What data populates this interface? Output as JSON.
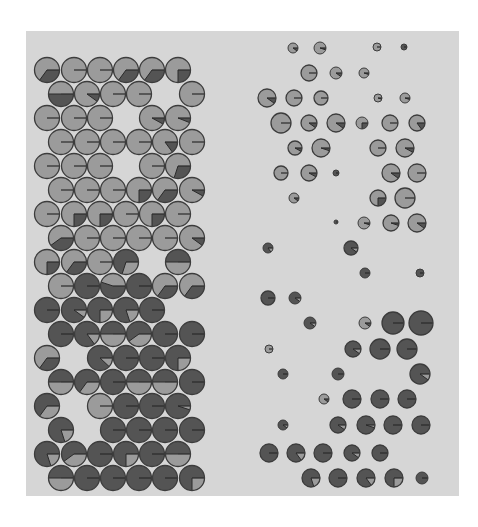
{
  "figure": {
    "colors": {
      "panel": "#d6d6d6",
      "light": "#9b9b9b",
      "dark": "#545454",
      "outline": "#3c3c3c",
      "line": "#2a2a2a"
    }
  },
  "chart_data": {
    "type": "scatter",
    "title": "",
    "xlabel": "",
    "ylabel": "",
    "grid": false,
    "legend": "none",
    "note": "Pie glyphs: base = base colour, f = fraction of wedge drawn in the other colour starting at 3 o'clock going clockwise; r = glyph radius in px",
    "left_grid": [
      {
        "x": 47,
        "y": 70,
        "r": 12.5,
        "base": "light",
        "f": 0.35
      },
      {
        "x": 74,
        "y": 70,
        "r": 12.5,
        "base": "light",
        "f": 0.0
      },
      {
        "x": 100,
        "y": 70,
        "r": 12.5,
        "base": "light",
        "f": 0.0
      },
      {
        "x": 126,
        "y": 70,
        "r": 12.5,
        "base": "light",
        "f": 0.35
      },
      {
        "x": 152,
        "y": 70,
        "r": 12.5,
        "base": "light",
        "f": 0.35
      },
      {
        "x": 178,
        "y": 70,
        "r": 12.5,
        "base": "light",
        "f": 0.25
      },
      {
        "x": 61,
        "y": 94,
        "r": 12.5,
        "base": "light",
        "f": 0.5
      },
      {
        "x": 87,
        "y": 94,
        "r": 12.5,
        "base": "light",
        "f": 0.1
      },
      {
        "x": 113,
        "y": 94,
        "r": 12.5,
        "base": "light",
        "f": 0.0
      },
      {
        "x": 139,
        "y": 94,
        "r": 12.5,
        "base": "light",
        "f": 0.0
      },
      {
        "x": 192,
        "y": 94,
        "r": 12.5,
        "base": "light",
        "f": 0.0
      },
      {
        "x": 47,
        "y": 118,
        "r": 12.5,
        "base": "light",
        "f": 0.0
      },
      {
        "x": 74,
        "y": 118,
        "r": 12.5,
        "base": "light",
        "f": 0.0
      },
      {
        "x": 100,
        "y": 118,
        "r": 12.5,
        "base": "light",
        "f": 0.0
      },
      {
        "x": 152,
        "y": 118,
        "r": 12.5,
        "base": "light",
        "f": 0.08
      },
      {
        "x": 178,
        "y": 118,
        "r": 12.5,
        "base": "light",
        "f": 0.06
      },
      {
        "x": 61,
        "y": 142,
        "r": 12.5,
        "base": "light",
        "f": 0.0
      },
      {
        "x": 87,
        "y": 142,
        "r": 12.5,
        "base": "light",
        "f": 0.0
      },
      {
        "x": 113,
        "y": 142,
        "r": 12.5,
        "base": "light",
        "f": 0.0
      },
      {
        "x": 139,
        "y": 142,
        "r": 12.5,
        "base": "light",
        "f": 0.0
      },
      {
        "x": 165,
        "y": 142,
        "r": 12.5,
        "base": "light",
        "f": 0.15
      },
      {
        "x": 192,
        "y": 142,
        "r": 12.5,
        "base": "light",
        "f": 0.0
      },
      {
        "x": 47,
        "y": 166,
        "r": 12.5,
        "base": "light",
        "f": 0.0
      },
      {
        "x": 74,
        "y": 166,
        "r": 12.5,
        "base": "light",
        "f": 0.0
      },
      {
        "x": 100,
        "y": 166,
        "r": 12.5,
        "base": "light",
        "f": 0.0
      },
      {
        "x": 152,
        "y": 166,
        "r": 12.5,
        "base": "light",
        "f": 0.0
      },
      {
        "x": 178,
        "y": 166,
        "r": 12.5,
        "base": "light",
        "f": 0.3
      },
      {
        "x": 61,
        "y": 190,
        "r": 12.5,
        "base": "light",
        "f": 0.0
      },
      {
        "x": 87,
        "y": 190,
        "r": 12.5,
        "base": "light",
        "f": 0.0
      },
      {
        "x": 113,
        "y": 190,
        "r": 12.5,
        "base": "light",
        "f": 0.0
      },
      {
        "x": 139,
        "y": 190,
        "r": 12.5,
        "base": "light",
        "f": 0.25
      },
      {
        "x": 165,
        "y": 190,
        "r": 12.5,
        "base": "light",
        "f": 0.35
      },
      {
        "x": 192,
        "y": 190,
        "r": 12.5,
        "base": "light",
        "f": 0.08
      },
      {
        "x": 47,
        "y": 214,
        "r": 12.5,
        "base": "light",
        "f": 0.0
      },
      {
        "x": 74,
        "y": 214,
        "r": 12.5,
        "base": "light",
        "f": 0.25
      },
      {
        "x": 100,
        "y": 214,
        "r": 12.5,
        "base": "light",
        "f": 0.25
      },
      {
        "x": 126,
        "y": 214,
        "r": 12.5,
        "base": "light",
        "f": 0.0
      },
      {
        "x": 152,
        "y": 214,
        "r": 12.5,
        "base": "light",
        "f": 0.25
      },
      {
        "x": 178,
        "y": 214,
        "r": 12.5,
        "base": "light",
        "f": 0.0
      },
      {
        "x": 61,
        "y": 238,
        "r": 12.5,
        "base": "light",
        "f": 0.4
      },
      {
        "x": 87,
        "y": 238,
        "r": 12.5,
        "base": "light",
        "f": 0.0
      },
      {
        "x": 113,
        "y": 238,
        "r": 12.5,
        "base": "light",
        "f": 0.0
      },
      {
        "x": 139,
        "y": 238,
        "r": 12.5,
        "base": "light",
        "f": 0.0
      },
      {
        "x": 165,
        "y": 238,
        "r": 12.5,
        "base": "light",
        "f": 0.0
      },
      {
        "x": 192,
        "y": 238,
        "r": 12.5,
        "base": "light",
        "f": 0.1
      },
      {
        "x": 47,
        "y": 262,
        "r": 12.5,
        "base": "light",
        "f": 0.25
      },
      {
        "x": 74,
        "y": 262,
        "r": 12.5,
        "base": "light",
        "f": 0.35
      },
      {
        "x": 100,
        "y": 262,
        "r": 12.5,
        "base": "light",
        "f": 0.0
      },
      {
        "x": 126,
        "y": 262,
        "r": 12.5,
        "base": "dark",
        "f": 0.3
      },
      {
        "x": 178,
        "y": 262,
        "r": 12.5,
        "base": "dark",
        "f": 0.5
      },
      {
        "x": 61,
        "y": 286,
        "r": 12.5,
        "base": "light",
        "f": 0.0
      },
      {
        "x": 87,
        "y": 286,
        "r": 12.5,
        "base": "dark",
        "f": 0.0
      },
      {
        "x": 113,
        "y": 286,
        "r": 12.5,
        "base": "light",
        "f": 0.55
      },
      {
        "x": 139,
        "y": 286,
        "r": 12.5,
        "base": "dark",
        "f": 0.0
      },
      {
        "x": 165,
        "y": 286,
        "r": 12.5,
        "base": "light",
        "f": 0.35
      },
      {
        "x": 192,
        "y": 286,
        "r": 12.5,
        "base": "light",
        "f": 0.35
      },
      {
        "x": 47,
        "y": 310,
        "r": 12.5,
        "base": "dark",
        "f": 0.0
      },
      {
        "x": 74,
        "y": 310,
        "r": 12.5,
        "base": "dark",
        "f": 0.1
      },
      {
        "x": 100,
        "y": 310,
        "r": 12.5,
        "base": "dark",
        "f": 0.25
      },
      {
        "x": 126,
        "y": 310,
        "r": 12.5,
        "base": "dark",
        "f": 0.2
      },
      {
        "x": 152,
        "y": 310,
        "r": 12.5,
        "base": "dark",
        "f": 0.0
      },
      {
        "x": 61,
        "y": 334,
        "r": 12.5,
        "base": "dark",
        "f": 0.0
      },
      {
        "x": 87,
        "y": 334,
        "r": 12.5,
        "base": "dark",
        "f": 0.15
      },
      {
        "x": 113,
        "y": 334,
        "r": 12.5,
        "base": "dark",
        "f": 0.5
      },
      {
        "x": 139,
        "y": 334,
        "r": 12.5,
        "base": "dark",
        "f": 0.4
      },
      {
        "x": 165,
        "y": 334,
        "r": 12.5,
        "base": "dark",
        "f": 0.0
      },
      {
        "x": 192,
        "y": 334,
        "r": 12.5,
        "base": "dark",
        "f": 0.0
      },
      {
        "x": 47,
        "y": 358,
        "r": 12.5,
        "base": "light",
        "f": 0.35
      },
      {
        "x": 100,
        "y": 358,
        "r": 12.5,
        "base": "dark",
        "f": 0.12
      },
      {
        "x": 126,
        "y": 358,
        "r": 12.5,
        "base": "dark",
        "f": 0.0
      },
      {
        "x": 152,
        "y": 358,
        "r": 12.5,
        "base": "dark",
        "f": 0.0
      },
      {
        "x": 178,
        "y": 358,
        "r": 12.5,
        "base": "dark",
        "f": 0.25
      },
      {
        "x": 61,
        "y": 382,
        "r": 12.5,
        "base": "dark",
        "f": 0.5
      },
      {
        "x": 87,
        "y": 382,
        "r": 12.5,
        "base": "dark",
        "f": 0.35
      },
      {
        "x": 113,
        "y": 382,
        "r": 12.5,
        "base": "dark",
        "f": 0.0
      },
      {
        "x": 139,
        "y": 382,
        "r": 12.5,
        "base": "dark",
        "f": 0.5
      },
      {
        "x": 165,
        "y": 382,
        "r": 12.5,
        "base": "dark",
        "f": 0.5
      },
      {
        "x": 192,
        "y": 382,
        "r": 12.5,
        "base": "dark",
        "f": 0.0
      },
      {
        "x": 47,
        "y": 406,
        "r": 12.5,
        "base": "dark",
        "f": 0.35
      },
      {
        "x": 100,
        "y": 406,
        "r": 12.5,
        "base": "light",
        "f": 0.0
      },
      {
        "x": 126,
        "y": 406,
        "r": 12.5,
        "base": "dark",
        "f": 0.0
      },
      {
        "x": 152,
        "y": 406,
        "r": 12.5,
        "base": "dark",
        "f": 0.0
      },
      {
        "x": 178,
        "y": 406,
        "r": 12.5,
        "base": "dark",
        "f": 0.05
      },
      {
        "x": 61,
        "y": 430,
        "r": 12.5,
        "base": "dark",
        "f": 0.2
      },
      {
        "x": 113,
        "y": 430,
        "r": 12.5,
        "base": "dark",
        "f": 0.0
      },
      {
        "x": 139,
        "y": 430,
        "r": 12.5,
        "base": "dark",
        "f": 0.0
      },
      {
        "x": 165,
        "y": 430,
        "r": 12.5,
        "base": "dark",
        "f": 0.0
      },
      {
        "x": 192,
        "y": 430,
        "r": 12.5,
        "base": "dark",
        "f": 0.0
      },
      {
        "x": 47,
        "y": 454,
        "r": 12.5,
        "base": "dark",
        "f": 0.2
      },
      {
        "x": 74,
        "y": 454,
        "r": 12.5,
        "base": "dark",
        "f": 0.4
      },
      {
        "x": 100,
        "y": 454,
        "r": 12.5,
        "base": "dark",
        "f": 0.0
      },
      {
        "x": 126,
        "y": 454,
        "r": 12.5,
        "base": "dark",
        "f": 0.25
      },
      {
        "x": 152,
        "y": 454,
        "r": 12.5,
        "base": "dark",
        "f": 0.0
      },
      {
        "x": 178,
        "y": 454,
        "r": 12.5,
        "base": "dark",
        "f": 0.5
      },
      {
        "x": 61,
        "y": 478,
        "r": 12.5,
        "base": "dark",
        "f": 0.5
      },
      {
        "x": 87,
        "y": 478,
        "r": 12.5,
        "base": "dark",
        "f": 0.0
      },
      {
        "x": 113,
        "y": 478,
        "r": 12.5,
        "base": "dark",
        "f": 0.0
      },
      {
        "x": 139,
        "y": 478,
        "r": 12.5,
        "base": "dark",
        "f": 0.0
      },
      {
        "x": 165,
        "y": 478,
        "r": 12.5,
        "base": "dark",
        "f": 0.0
      },
      {
        "x": 192,
        "y": 478,
        "r": 12.5,
        "base": "dark",
        "f": 0.25
      }
    ],
    "right_grid": [
      {
        "x": 293,
        "y": 48,
        "r": 5,
        "base": "light",
        "f": 0.1
      },
      {
        "x": 320,
        "y": 48,
        "r": 6,
        "base": "light",
        "f": 0.05
      },
      {
        "x": 377,
        "y": 47,
        "r": 4,
        "base": "light",
        "f": 0.0
      },
      {
        "x": 404,
        "y": 47,
        "r": 3,
        "base": "dark",
        "f": 0.0
      },
      {
        "x": 309,
        "y": 73,
        "r": 8,
        "base": "light",
        "f": 0.0
      },
      {
        "x": 336,
        "y": 73,
        "r": 6,
        "base": "light",
        "f": 0.1
      },
      {
        "x": 364,
        "y": 73,
        "r": 5,
        "base": "light",
        "f": 0.05
      },
      {
        "x": 267,
        "y": 98,
        "r": 9,
        "base": "light",
        "f": 0.1
      },
      {
        "x": 294,
        "y": 98,
        "r": 8,
        "base": "light",
        "f": 0.0
      },
      {
        "x": 321,
        "y": 98,
        "r": 7,
        "base": "light",
        "f": 0.0
      },
      {
        "x": 378,
        "y": 98,
        "r": 4,
        "base": "light",
        "f": 0.05
      },
      {
        "x": 405,
        "y": 98,
        "r": 5,
        "base": "light",
        "f": 0.05
      },
      {
        "x": 281,
        "y": 123,
        "r": 10,
        "base": "light",
        "f": 0.0
      },
      {
        "x": 309,
        "y": 123,
        "r": 8,
        "base": "light",
        "f": 0.1
      },
      {
        "x": 336,
        "y": 123,
        "r": 9,
        "base": "light",
        "f": 0.1
      },
      {
        "x": 362,
        "y": 123,
        "r": 6,
        "base": "light",
        "f": 0.25
      },
      {
        "x": 390,
        "y": 123,
        "r": 8,
        "base": "light",
        "f": 0.0
      },
      {
        "x": 417,
        "y": 123,
        "r": 8,
        "base": "light",
        "f": 0.15
      },
      {
        "x": 295,
        "y": 148,
        "r": 7,
        "base": "light",
        "f": 0.08
      },
      {
        "x": 321,
        "y": 148,
        "r": 9,
        "base": "light",
        "f": 0.05
      },
      {
        "x": 378,
        "y": 148,
        "r": 8,
        "base": "light",
        "f": 0.0
      },
      {
        "x": 405,
        "y": 148,
        "r": 9,
        "base": "light",
        "f": 0.08
      },
      {
        "x": 281,
        "y": 173,
        "r": 7,
        "base": "light",
        "f": 0.0
      },
      {
        "x": 309,
        "y": 173,
        "r": 8,
        "base": "light",
        "f": 0.08
      },
      {
        "x": 336,
        "y": 173,
        "r": 3,
        "base": "dark",
        "f": 0.0
      },
      {
        "x": 391,
        "y": 173,
        "r": 9,
        "base": "light",
        "f": 0.1
      },
      {
        "x": 417,
        "y": 173,
        "r": 9,
        "base": "light",
        "f": 0.0
      },
      {
        "x": 294,
        "y": 198,
        "r": 5,
        "base": "light",
        "f": 0.1
      },
      {
        "x": 378,
        "y": 198,
        "r": 8,
        "base": "light",
        "f": 0.25
      },
      {
        "x": 405,
        "y": 198,
        "r": 10,
        "base": "light",
        "f": 0.0
      },
      {
        "x": 336,
        "y": 222,
        "r": 2,
        "base": "dark",
        "f": 0.0
      },
      {
        "x": 364,
        "y": 223,
        "r": 6,
        "base": "light",
        "f": 0.05
      },
      {
        "x": 391,
        "y": 223,
        "r": 8,
        "base": "light",
        "f": 0.05
      },
      {
        "x": 417,
        "y": 223,
        "r": 9,
        "base": "light",
        "f": 0.1
      },
      {
        "x": 268,
        "y": 248,
        "r": 5,
        "base": "dark",
        "f": 0.15
      },
      {
        "x": 351,
        "y": 248,
        "r": 7,
        "base": "dark",
        "f": 0.1
      },
      {
        "x": 365,
        "y": 273,
        "r": 5,
        "base": "dark",
        "f": 0.0
      },
      {
        "x": 420,
        "y": 273,
        "r": 4,
        "base": "dark",
        "f": 0.0
      },
      {
        "x": 268,
        "y": 298,
        "r": 7,
        "base": "dark",
        "f": 0.0
      },
      {
        "x": 295,
        "y": 298,
        "r": 6,
        "base": "dark",
        "f": 0.1
      },
      {
        "x": 310,
        "y": 323,
        "r": 6,
        "base": "dark",
        "f": 0.1
      },
      {
        "x": 365,
        "y": 323,
        "r": 6,
        "base": "light",
        "f": 0.1
      },
      {
        "x": 393,
        "y": 323,
        "r": 11,
        "base": "dark",
        "f": 0.0
      },
      {
        "x": 421,
        "y": 323,
        "r": 12,
        "base": "dark",
        "f": 0.0
      },
      {
        "x": 269,
        "y": 349,
        "r": 4,
        "base": "light",
        "f": 0.0
      },
      {
        "x": 353,
        "y": 349,
        "r": 8,
        "base": "dark",
        "f": 0.1
      },
      {
        "x": 380,
        "y": 349,
        "r": 10,
        "base": "dark",
        "f": 0.0
      },
      {
        "x": 407,
        "y": 349,
        "r": 10,
        "base": "dark",
        "f": 0.0
      },
      {
        "x": 283,
        "y": 374,
        "r": 5,
        "base": "dark",
        "f": 0.0
      },
      {
        "x": 338,
        "y": 374,
        "r": 6,
        "base": "dark",
        "f": 0.0
      },
      {
        "x": 420,
        "y": 374,
        "r": 10,
        "base": "dark",
        "f": 0.1
      },
      {
        "x": 324,
        "y": 399,
        "r": 5,
        "base": "light",
        "f": 0.1
      },
      {
        "x": 352,
        "y": 399,
        "r": 9,
        "base": "dark",
        "f": 0.0
      },
      {
        "x": 380,
        "y": 399,
        "r": 9,
        "base": "dark",
        "f": 0.0
      },
      {
        "x": 407,
        "y": 399,
        "r": 9,
        "base": "dark",
        "f": 0.0
      },
      {
        "x": 283,
        "y": 425,
        "r": 5,
        "base": "dark",
        "f": 0.1
      },
      {
        "x": 338,
        "y": 425,
        "r": 8,
        "base": "dark",
        "f": 0.1
      },
      {
        "x": 366,
        "y": 425,
        "r": 9,
        "base": "dark",
        "f": 0.05
      },
      {
        "x": 393,
        "y": 425,
        "r": 9,
        "base": "dark",
        "f": 0.0
      },
      {
        "x": 421,
        "y": 425,
        "r": 9,
        "base": "dark",
        "f": 0.0
      },
      {
        "x": 269,
        "y": 453,
        "r": 9,
        "base": "dark",
        "f": 0.0
      },
      {
        "x": 296,
        "y": 453,
        "r": 9,
        "base": "dark",
        "f": 0.15
      },
      {
        "x": 323,
        "y": 453,
        "r": 9,
        "base": "dark",
        "f": 0.0
      },
      {
        "x": 352,
        "y": 453,
        "r": 8,
        "base": "dark",
        "f": 0.1
      },
      {
        "x": 380,
        "y": 453,
        "r": 8,
        "base": "dark",
        "f": 0.0
      },
      {
        "x": 311,
        "y": 478,
        "r": 9,
        "base": "dark",
        "f": 0.2
      },
      {
        "x": 338,
        "y": 478,
        "r": 9,
        "base": "dark",
        "f": 0.0
      },
      {
        "x": 366,
        "y": 478,
        "r": 9,
        "base": "dark",
        "f": 0.15
      },
      {
        "x": 394,
        "y": 478,
        "r": 9,
        "base": "dark",
        "f": 0.25
      },
      {
        "x": 422,
        "y": 478,
        "r": 6,
        "base": "dark",
        "f": 0.0
      }
    ]
  }
}
